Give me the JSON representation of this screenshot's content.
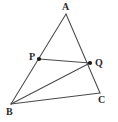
{
  "figure": {
    "kind": "geometry-diagram",
    "background_color": "#ffffff",
    "line_color": "#4a4a4a",
    "dot_color": "#1a1a1a",
    "label_color": "#2b2b2b",
    "points": {
      "A": {
        "label": "A",
        "x": 66,
        "y": 14
      },
      "P": {
        "label": "P",
        "x": 39,
        "y": 59
      },
      "Q": {
        "label": "Q",
        "x": 90,
        "y": 63
      },
      "B": {
        "label": "B",
        "x": 11,
        "y": 104
      },
      "C": {
        "label": "C",
        "x": 100,
        "y": 93
      }
    },
    "segments": [
      {
        "name": "AB",
        "from": "A",
        "to": "B"
      },
      {
        "name": "AC",
        "from": "A",
        "to": "C"
      },
      {
        "name": "BC",
        "from": "B",
        "to": "C"
      },
      {
        "name": "PQ",
        "from": "P",
        "to": "Q"
      },
      {
        "name": "BQ",
        "from": "B",
        "to": "Q"
      }
    ],
    "marked_points": [
      "P",
      "Q"
    ]
  }
}
